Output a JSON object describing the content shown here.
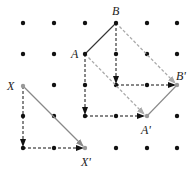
{
  "diagram": {
    "type": "translation-on-dot-grid",
    "grid": {
      "columns": 6,
      "rows": 5,
      "x_positions": [
        23,
        54,
        85,
        116,
        147,
        177
      ],
      "y_positions": [
        23,
        54,
        85,
        116,
        148
      ],
      "dot_color": "#111111"
    },
    "points": {
      "A": {
        "label": "A",
        "grid": [
          2,
          1
        ]
      },
      "B": {
        "label": "B",
        "grid": [
          3,
          0
        ]
      },
      "A_prime": {
        "label": "A'",
        "grid": [
          4,
          3
        ]
      },
      "B_prime": {
        "label": "B'",
        "grid": [
          5,
          2
        ]
      },
      "X": {
        "label": "X",
        "grid": [
          0,
          2
        ]
      },
      "X_prime": {
        "label": "X'",
        "grid": [
          2,
          4
        ]
      }
    },
    "segments": [
      {
        "name": "AB",
        "style": "solid",
        "color": "#333333"
      },
      {
        "name": "A'B'",
        "style": "solid",
        "color": "#888888"
      }
    ],
    "translation_vector": {
      "right": 2,
      "down": 2
    },
    "arrows": [
      {
        "from": "X",
        "to": "X'",
        "style": "solid",
        "color": "#888888"
      },
      {
        "from": "A",
        "to": "A'",
        "style": "dashed",
        "color": "#aaaaaa"
      },
      {
        "from": "B",
        "to": "B'",
        "style": "dashed",
        "color": "#aaaaaa"
      },
      {
        "from": "X",
        "to": "down-2",
        "style": "dashed",
        "color": "#111111"
      },
      {
        "from": "down-2",
        "to": "X'",
        "style": "dashed",
        "color": "#111111"
      },
      {
        "from": "A",
        "to": "down-2",
        "style": "dashed",
        "color": "#111111"
      },
      {
        "from": "down-2",
        "to": "A'",
        "style": "dashed",
        "color": "#111111"
      },
      {
        "from": "B",
        "to": "down-2",
        "style": "dashed",
        "color": "#111111"
      },
      {
        "from": "down-2",
        "to": "B'",
        "style": "dashed",
        "color": "#111111"
      }
    ]
  }
}
